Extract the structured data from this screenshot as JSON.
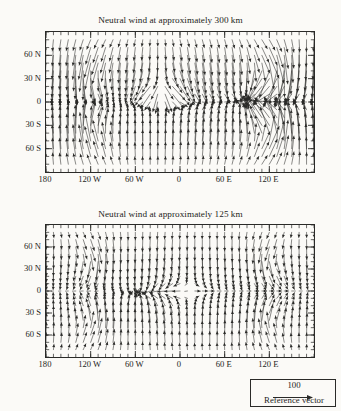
{
  "figure": {
    "background_color": "#fbfaf7",
    "ink_color": "#2a2a28"
  },
  "panels": [
    {
      "id": "top",
      "title": "Neutral wind at approximately 300 km"
    },
    {
      "id": "bottom",
      "title": "Neutral wind at approximately 125 km"
    }
  ],
  "legend": {
    "value": "100",
    "caption": "Reference vector",
    "arrow_icon": "right-arrow-icon"
  },
  "chart_data": {
    "type": "quiver",
    "xlabel": "",
    "ylabel": "",
    "xlim": [
      -180,
      180
    ],
    "ylim": [
      -90,
      90
    ],
    "grid": false,
    "legend_position": "bottom-right",
    "reference_vector_magnitude": 100,
    "reference_vector_units": "m/s",
    "x_ticks": [
      {
        "value": -180,
        "label": "180"
      },
      {
        "value": -120,
        "label": "120 W"
      },
      {
        "value": -60,
        "label": "60 W"
      },
      {
        "value": 0,
        "label": "0"
      },
      {
        "value": 60,
        "label": "60 E"
      },
      {
        "value": 120,
        "label": "120 E"
      }
    ],
    "y_ticks": [
      {
        "value": 60,
        "label": "60 N"
      },
      {
        "value": 30,
        "label": "30 N"
      },
      {
        "value": 0,
        "label": "0"
      },
      {
        "value": -30,
        "label": "30 S"
      },
      {
        "value": -60,
        "label": "60 S"
      }
    ],
    "x_minor_tick_interval": 10,
    "y_minor_tick_interval": 10,
    "grid_resolution": {
      "nx": 37,
      "ny": 19
    },
    "panels": [
      {
        "name": "300 km",
        "altitude_km": 300,
        "description": "Strong day-to-night circulation: convergence near 90 E, divergence near 30 W; large anticyclonic gyre over the eastern hemisphere in both hemispheres; strong cross-polar and equatorward flow; vectors largest (near 100 m/s reference) in the subauroral eastern hemisphere.",
        "flow_features": [
          {
            "type": "divergence",
            "lon": -25,
            "lat": 18,
            "strength": 1.0
          },
          {
            "type": "convergence",
            "lon": 95,
            "lat": 5,
            "strength": 0.9
          },
          {
            "type": "vortex",
            "lon": 120,
            "lat": 45,
            "sense": "clockwise",
            "strength": 0.95
          },
          {
            "type": "vortex",
            "lon": 120,
            "lat": -45,
            "sense": "counterclockwise",
            "strength": 0.95
          },
          {
            "type": "vortex",
            "lon": -115,
            "lat": 42,
            "sense": "counterclockwise",
            "strength": 0.5
          },
          {
            "type": "vortex",
            "lon": -115,
            "lat": -42,
            "sense": "clockwise",
            "strength": 0.5
          }
        ],
        "max_speed": 100,
        "typical_speed": 60
      },
      {
        "name": "125 km",
        "altitude_km": 125,
        "description": "Weaker, more regular four-cell tidal pattern; equatorial jets near 0 deg latitude; convergence near 55 W and divergence near 10 E; vector magnitudes roughly half of the 300 km panel.",
        "flow_features": [
          {
            "type": "convergence",
            "lon": -55,
            "lat": -8,
            "strength": 0.8
          },
          {
            "type": "divergence",
            "lon": 10,
            "lat": 0,
            "strength": 0.7
          },
          {
            "type": "vortex",
            "lon": -120,
            "lat": 45,
            "sense": "clockwise",
            "strength": 0.6
          },
          {
            "type": "vortex",
            "lon": -120,
            "lat": -45,
            "sense": "counterclockwise",
            "strength": 0.6
          },
          {
            "type": "vortex",
            "lon": 120,
            "lat": 45,
            "sense": "counterclockwise",
            "strength": 0.6
          },
          {
            "type": "vortex",
            "lon": 120,
            "lat": -45,
            "sense": "clockwise",
            "strength": 0.6
          }
        ],
        "max_speed": 55,
        "typical_speed": 28
      }
    ]
  }
}
